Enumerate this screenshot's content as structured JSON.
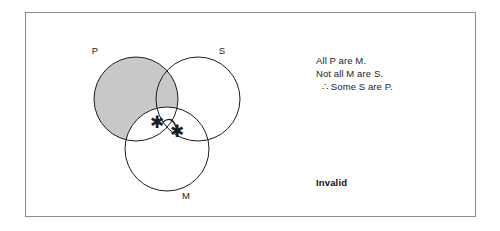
{
  "figure": {
    "type": "venn-diagram-syllogism",
    "frame": {
      "border_color": "#8d8d8d",
      "background": "#ffffff"
    }
  },
  "venn": {
    "shading_color": "#c8c8c8",
    "stroke_color": "#1c1c1c",
    "circles": [
      {
        "id": "P",
        "label": "P",
        "cx": 55,
        "cy": 60,
        "r": 42
      },
      {
        "id": "S",
        "label": "S",
        "cx": 117,
        "cy": 60,
        "r": 42
      },
      {
        "id": "M",
        "label": "M",
        "cx": 86,
        "cy": 110,
        "r": 42
      }
    ],
    "labels": {
      "p": "P",
      "s": "S",
      "m": "M"
    },
    "shaded_region_description": "P outside M",
    "markers": [
      {
        "name": "asterisk",
        "symbol": "✱"
      },
      {
        "name": "asterisk",
        "symbol": "✱"
      }
    ],
    "marker_link": "arc-bar"
  },
  "argument": {
    "premise_1": "All P are M.",
    "premise_2": "Not all M are S.",
    "conclusion": "∴ Some S are P."
  },
  "verdict": {
    "label": "Invalid"
  }
}
